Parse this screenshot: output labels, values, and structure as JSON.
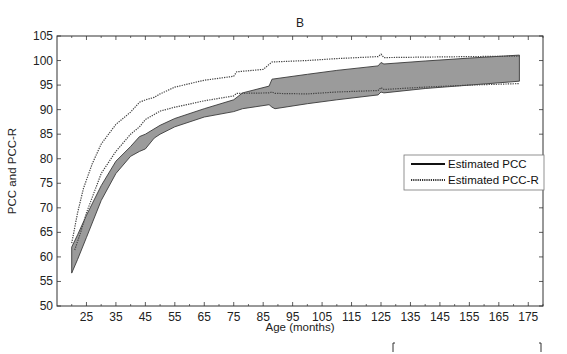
{
  "chart_data": {
    "type": "area",
    "title": "B",
    "xlabel": "Age (months)",
    "ylabel": "PCC and PCC-R",
    "xlim": [
      15,
      180
    ],
    "ylim": [
      50,
      105
    ],
    "xticks": [
      25,
      35,
      45,
      55,
      65,
      75,
      85,
      95,
      105,
      115,
      125,
      135,
      145,
      155,
      165,
      175
    ],
    "yticks": [
      50,
      55,
      60,
      65,
      70,
      75,
      80,
      85,
      90,
      95,
      100,
      105
    ],
    "grid": false,
    "legend_position": "right-center",
    "legend": [
      "Estimated PCC",
      "Estimated PCC-R"
    ],
    "series": [
      {
        "name": "Estimated PCC",
        "style": "solid band (shaded gray)",
        "upper": {
          "x": [
            20,
            22,
            25,
            30,
            35,
            40,
            43,
            45,
            50,
            55,
            65,
            75,
            78,
            87,
            88,
            100,
            110,
            124,
            125,
            126,
            140,
            155,
            172
          ],
          "y": [
            62,
            64.5,
            68.5,
            74.5,
            79.5,
            82.5,
            84.5,
            85,
            86.8,
            88.2,
            90.2,
            92,
            93.4,
            94.8,
            96.2,
            97.2,
            98,
            98.9,
            99.6,
            99.3,
            99.9,
            100.5,
            101.1
          ]
        },
        "lower": {
          "x": [
            20,
            22,
            25,
            30,
            35,
            40,
            43,
            45,
            48,
            50,
            55,
            65,
            75,
            78,
            87,
            88,
            89,
            100,
            110,
            124,
            125,
            126,
            140,
            155,
            172
          ],
          "y": [
            56.7,
            59.5,
            64,
            71.5,
            77,
            80.5,
            81.5,
            82,
            84.2,
            85,
            86.5,
            88.5,
            89.6,
            90.2,
            91,
            90.5,
            90.2,
            91.2,
            92,
            93,
            93.6,
            93.4,
            94.3,
            95,
            95.8
          ]
        }
      },
      {
        "name": "Estimated PCC-R",
        "style": "dotted pair",
        "upper": {
          "x": [
            20,
            22,
            24,
            27,
            30,
            35,
            40,
            43,
            45,
            48,
            50,
            55,
            65,
            75,
            76,
            85,
            88,
            100,
            110,
            124,
            125,
            126,
            140,
            155,
            172
          ],
          "y": [
            62.8,
            69,
            74,
            79,
            83,
            87,
            89.5,
            91.5,
            92,
            92.5,
            93.2,
            94.6,
            96,
            96.8,
            97.7,
            98.2,
            99.7,
            100,
            100.4,
            100.8,
            101.3,
            100.6,
            100.7,
            100.8,
            100.9
          ]
        },
        "lower": {
          "x": [
            21,
            23,
            25,
            30,
            35,
            40,
            43,
            45,
            48,
            50,
            55,
            65,
            75,
            76,
            87,
            88,
            89,
            100,
            110,
            124,
            125,
            126,
            140,
            155,
            172
          ],
          "y": [
            61.4,
            65,
            69,
            77,
            81.5,
            85,
            86.5,
            88,
            89,
            89.7,
            90.5,
            91.8,
            92.8,
            93.3,
            93.4,
            93.6,
            93.3,
            93.2,
            93.6,
            93.9,
            94.5,
            94.1,
            94.6,
            95,
            95.3
          ]
        }
      }
    ]
  },
  "legend": {
    "items": [
      {
        "label": "Estimated PCC",
        "style": "solid"
      },
      {
        "label": "Estimated PCC-R",
        "style": "dotted"
      }
    ]
  },
  "colors": {
    "band_fill": "#8a8a8a",
    "band_edge": "#3a3a3a",
    "dotted": "#444444",
    "axis": "#333333"
  }
}
